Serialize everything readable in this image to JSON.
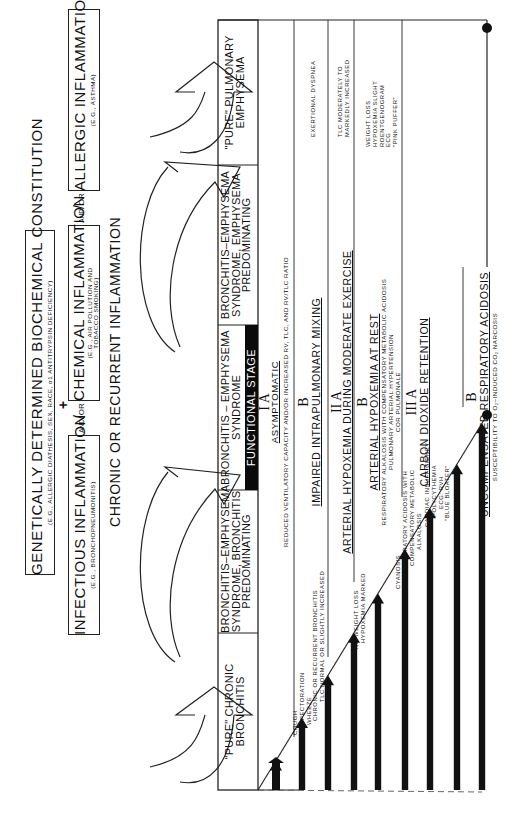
{
  "top": {
    "constitution": {
      "title": "GENETICALLY DETERMINED BIOCHEMICAL CONSTITUTION",
      "subtitle": "(E.G., ALLERGIC DIATHESIS, SEX, RACE, α1 ANTITRYPSIN DEFICIENCY)"
    },
    "plus": "+",
    "inflammations": [
      {
        "title": "INFECTIOUS INFLAMMATION",
        "subtitle": "(E.G., BRONCHOPNEUMONITIS)"
      },
      {
        "title": "CHEMICAL INFLAMMATION",
        "subtitle_line1": "(E.G., AIR POLLUTION AND",
        "subtitle_line2": "TOBACCO SMOKING)"
      },
      {
        "title": "ALLERGIC INFLAMMATION",
        "subtitle": "(E.G., ASTHMA)"
      }
    ],
    "and_or": {
      "and": "AND",
      "or": "OR"
    },
    "result": "CHRONIC OR RECURRENT INFLAMMATION"
  },
  "columns": [
    {
      "line1": "\"PURE\" CHRONIC",
      "line2": "BRONCHITIS",
      "line3": ""
    },
    {
      "line1": "BRONCHITIS–EMPHYSEMA",
      "line2": "SYNDROME, BRONCHITIS",
      "line3": "PREDOMINATING"
    },
    {
      "line1": "BRONCHITIS – EMPHYSEMA",
      "line2": "SYNDROME",
      "line3": ""
    },
    {
      "line1": "BRONCHITIS–EMPHYSEMA",
      "line2": "SYNDROME, EMPHYSEMA",
      "line3": "PREDOMINATING"
    },
    {
      "line1": "\"PURE\" PULMONARY",
      "line2": "EMPHYSEMA",
      "line3": ""
    }
  ],
  "functional_stage_label": "FUNCTIONAL STAGE",
  "stages": [
    {
      "numeral": "I A",
      "title": "ASYMPTOMATIC",
      "detail": "REDUCED VENTILATORY CAPACITY AND/OR INCREASED RV, TLC, AND RV/TLC RATIO"
    },
    {
      "numeral": "B",
      "title": "IMPAIRED INTRAPULMONARY MIXING",
      "detail": ""
    },
    {
      "numeral": "II A",
      "title": "ARTERIAL HYPOXEMIA DURING MODERATE EXERCISE",
      "detail": ""
    },
    {
      "numeral": "B",
      "title": "ARTERIAL HYPOXEMIA AT REST",
      "detail_lines": [
        "RESPIRATORY ALKALOSIS WITH COMPENSATORY METABOLIC ACIDOSIS",
        "PULMONARY ARTERIAL HYPERTENSION",
        "COR PULMONALE"
      ]
    },
    {
      "numeral": "III A",
      "title": "CARBON DIOXIDE RETENTION",
      "detail": ""
    },
    {
      "numeral": "B",
      "title": "UNCOMPENSATED RESPIRATORY ACIDOSIS",
      "detail": "SUSCEPTIBILITY TO O₂–INDUCED CO₂ NARCOSIS"
    }
  ],
  "bronchitis_signs": [
    [
      "COUGH",
      "EXPECTORATION",
      "WHEEZE",
      "CHRONIC OR RECURRENT BRONCHITIS"
    ],
    [
      "TLC NORMAL OR SLIGHTLY INCREASED"
    ],
    [
      "NO WEIGHT LOSS",
      "HYPOXEMIA MARKED"
    ],
    [
      "CYANOSIS"
    ],
    [
      "RESPIRATORY ACIDOSIS WITH",
      "COMPENSATORY METABOLIC",
      "ALKALOSIS"
    ],
    [
      "CARDIAC INSUFFICIENCY",
      "POLYCYTHEMIA",
      "ECG: RVH",
      "\"BLUE BLOATER\""
    ]
  ],
  "emphysema_signs": [
    [
      "EXERTIONAL DYSPNEA"
    ],
    [
      "TLC MODERATELY TO",
      "MARKEDLY INCREASED"
    ],
    [
      "WEIGHT LOSS",
      "HYPOXEMIA SLIGHT",
      "ROENTGENOGRAM",
      "ECG",
      "\"PINK PUFFER\""
    ]
  ],
  "colors": {
    "ink": "#111111",
    "paper": "#ffffff",
    "stage_box": "#0a0a0a"
  }
}
